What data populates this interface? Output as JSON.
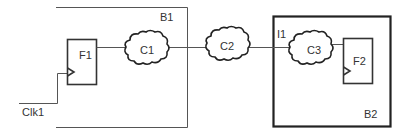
{
  "diagram": {
    "blocks": [
      {
        "id": "B1",
        "label": "B1"
      },
      {
        "id": "B2",
        "label": "B2"
      }
    ],
    "flipflops": [
      {
        "id": "F1",
        "label": "F1"
      },
      {
        "id": "F2",
        "label": "F2"
      }
    ],
    "clouds": [
      {
        "id": "C1",
        "label": "C1"
      },
      {
        "id": "C2",
        "label": "C2"
      },
      {
        "id": "C3",
        "label": "C3"
      }
    ],
    "ports": [
      {
        "id": "I1",
        "label": "I1"
      }
    ],
    "signals": [
      {
        "id": "Clk1",
        "label": "Clk1"
      }
    ],
    "connections": [
      [
        "Clk1",
        "F1.clk"
      ],
      [
        "F1",
        "C1"
      ],
      [
        "C1",
        "C2"
      ],
      [
        "C2",
        "I1"
      ],
      [
        "I1",
        "C3"
      ],
      [
        "C3",
        "F2"
      ]
    ]
  }
}
